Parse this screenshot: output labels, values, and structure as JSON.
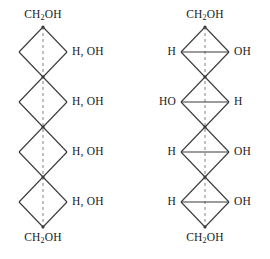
{
  "diagram": {
    "type": "fischer-projection-pair",
    "background_color": "#ffffff",
    "bond_color": "#3a3a3a",
    "axis_color": "#808080",
    "structures": [
      {
        "id": "left",
        "name": "unspecified-stereochemistry-hexitol",
        "center_x": 43,
        "top_vertex_y": 27,
        "diamond_width": 48,
        "diamond_height": 50,
        "diamond_count": 4,
        "has_horizontal_bonds": false,
        "top_terminal": "CH2OH",
        "bottom_terminal": "CH2OH",
        "top_terminal_text": "CH",
        "top_terminal_sub": "2",
        "top_terminal_tail": "OH",
        "bottom_terminal_text": "CH",
        "bottom_terminal_sub": "2",
        "bottom_terminal_tail": "OH",
        "substituents": [
          {
            "index": 1,
            "left": "",
            "right": "H, OH"
          },
          {
            "index": 2,
            "left": "",
            "right": "H, OH"
          },
          {
            "index": 3,
            "left": "",
            "right": "H, OH"
          },
          {
            "index": 4,
            "left": "",
            "right": "H, OH"
          }
        ]
      },
      {
        "id": "right",
        "name": "defined-stereochemistry-hexitol",
        "center_x": 70,
        "top_vertex_y": 27,
        "diamond_width": 48,
        "diamond_height": 50,
        "diamond_count": 4,
        "has_horizontal_bonds": true,
        "top_terminal": "CH2OH",
        "bottom_terminal": "CH2OH",
        "top_terminal_text": "CH",
        "top_terminal_sub": "2",
        "top_terminal_tail": "OH",
        "bottom_terminal_text": "CH",
        "bottom_terminal_sub": "2",
        "bottom_terminal_tail": "OH",
        "substituents": [
          {
            "index": 1,
            "left": "H",
            "right": "OH"
          },
          {
            "index": 2,
            "left": "HO",
            "right": "H"
          },
          {
            "index": 3,
            "left": "H",
            "right": "OH"
          },
          {
            "index": 4,
            "left": "H",
            "right": "OH"
          }
        ]
      }
    ]
  }
}
